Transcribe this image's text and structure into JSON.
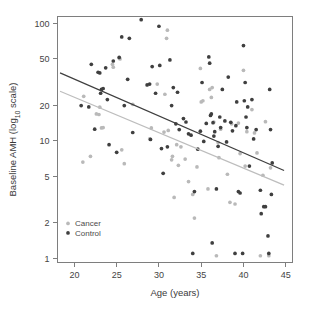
{
  "chart_data": {
    "type": "scatter",
    "title": "",
    "xlabel": "Age (years)",
    "ylabel": "Baseline AMH (log10 scale)",
    "ylabel_parts": {
      "pre": "Baseline AMH (log",
      "sub": "10",
      "post": " scale)"
    },
    "xlim": [
      18,
      45.8
    ],
    "ylim": [
      0.92,
      115
    ],
    "yscale": "log10",
    "xticks": [
      20,
      25,
      30,
      35,
      40,
      45
    ],
    "xtick_labels": [
      "20",
      "25",
      "30",
      "35",
      "40",
      "45"
    ],
    "yticks": [
      1,
      2,
      5,
      10,
      20,
      50,
      100
    ],
    "ytick_labels": [
      "1",
      "2",
      "5",
      "10",
      "20",
      "50",
      "100"
    ],
    "grid": false,
    "legend_position": "bottom-left",
    "legend": [
      {
        "name": "Cancer",
        "color": "#b9b9b9",
        "marker": "circle"
      },
      {
        "name": "Control",
        "color": "#3f3f3f",
        "marker": "circle"
      }
    ],
    "series": [
      {
        "name": "Cancer",
        "color": "#b9b9b9",
        "points": [
          [
            21.0,
            6.6
          ],
          [
            21.1,
            24.0
          ],
          [
            21.9,
            7.4
          ],
          [
            22.6,
            17.0
          ],
          [
            22.9,
            16.8
          ],
          [
            23.0,
            19.4
          ],
          [
            23.2,
            12.9
          ],
          [
            23.4,
            13.0
          ],
          [
            24.5,
            45.0
          ],
          [
            24.6,
            42.5
          ],
          [
            25.3,
            51.0
          ],
          [
            25.4,
            50.0
          ],
          [
            25.6,
            8.4
          ],
          [
            25.9,
            6.4
          ],
          [
            26.9,
            20.5
          ],
          [
            28.9,
            10.4
          ],
          [
            29.1,
            12.9
          ],
          [
            29.8,
            30.5
          ],
          [
            30.6,
            11.9
          ],
          [
            30.7,
            25.0
          ],
          [
            30.9,
            75.0
          ],
          [
            31.0,
            88.0
          ],
          [
            31.1,
            12.3
          ],
          [
            31.5,
            6.9
          ],
          [
            31.6,
            7.4
          ],
          [
            31.8,
            3.3
          ],
          [
            32.1,
            9.3
          ],
          [
            32.3,
            6.2
          ],
          [
            32.6,
            8.9
          ],
          [
            33.1,
            7.0
          ],
          [
            33.5,
            4.5
          ],
          [
            34.0,
            3.5
          ],
          [
            34.2,
            2.2
          ],
          [
            34.5,
            6.0
          ],
          [
            34.9,
            41.5
          ],
          [
            35.0,
            21.5
          ],
          [
            35.2,
            22.0
          ],
          [
            35.8,
            3.9
          ],
          [
            36.0,
            27.5
          ],
          [
            36.2,
            23.5
          ],
          [
            36.3,
            28.5
          ],
          [
            36.5,
            14.5
          ],
          [
            36.8,
            1.05
          ],
          [
            37.0,
            9.7
          ],
          [
            37.1,
            7.2
          ],
          [
            37.3,
            12.6
          ],
          [
            38.1,
            5.2
          ],
          [
            38.4,
            3.0
          ],
          [
            38.6,
            14.0
          ],
          [
            39.0,
            2.9
          ],
          [
            39.4,
            14.2
          ],
          [
            39.6,
            7.8
          ],
          [
            40.0,
            40.0
          ],
          [
            40.2,
            6.1
          ],
          [
            40.4,
            12.0
          ],
          [
            41.0,
            18.5
          ],
          [
            41.3,
            11.7
          ],
          [
            41.6,
            7.9
          ],
          [
            42.0,
            1.05
          ],
          [
            42.3,
            5.1
          ],
          [
            42.6,
            14.6
          ],
          [
            43.0,
            1.05
          ],
          [
            43.2,
            5.9
          ]
        ]
      },
      {
        "name": "Control",
        "color": "#3f3f3f",
        "points": [
          [
            20.8,
            20.0
          ],
          [
            21.7,
            19.5
          ],
          [
            22.0,
            45.0
          ],
          [
            22.4,
            12.6
          ],
          [
            22.8,
            38.5
          ],
          [
            23.0,
            38.0
          ],
          [
            23.1,
            25.5
          ],
          [
            23.2,
            27.5
          ],
          [
            23.4,
            28.0
          ],
          [
            23.7,
            42.0
          ],
          [
            23.9,
            22.5
          ],
          [
            24.1,
            9.3
          ],
          [
            24.6,
            48.0
          ],
          [
            25.0,
            8.0
          ],
          [
            25.3,
            51.5
          ],
          [
            25.6,
            77.0
          ],
          [
            25.9,
            20.0
          ],
          [
            26.3,
            33.5
          ],
          [
            26.5,
            75.0
          ],
          [
            26.9,
            11.8
          ],
          [
            27.9,
            108.0
          ],
          [
            28.6,
            30.0
          ],
          [
            28.9,
            30.5
          ],
          [
            29.0,
            10.3
          ],
          [
            29.2,
            43.0
          ],
          [
            29.6,
            25.5
          ],
          [
            30.0,
            95.0
          ],
          [
            30.1,
            44.0
          ],
          [
            30.3,
            8.6
          ],
          [
            30.5,
            5.3
          ],
          [
            31.0,
            8.9
          ],
          [
            31.3,
            49.0
          ],
          [
            31.5,
            20.0
          ],
          [
            31.7,
            28.5
          ],
          [
            32.0,
            14.0
          ],
          [
            32.2,
            26.0
          ],
          [
            32.4,
            12.5
          ],
          [
            32.9,
            15.5
          ],
          [
            33.2,
            14.5
          ],
          [
            33.5,
            11.5
          ],
          [
            33.8,
            11.2
          ],
          [
            34.0,
            1.1
          ],
          [
            34.2,
            3.7
          ],
          [
            34.6,
            8.5
          ],
          [
            34.9,
            12.1
          ],
          [
            35.1,
            31.5
          ],
          [
            35.3,
            9.9
          ],
          [
            35.6,
            14.1
          ],
          [
            35.9,
            52.0
          ],
          [
            36.0,
            46.0
          ],
          [
            36.1,
            16.5
          ],
          [
            36.2,
            17.0
          ],
          [
            36.3,
            1.35
          ],
          [
            36.4,
            14.3
          ],
          [
            36.5,
            11.0
          ],
          [
            36.6,
            12.0
          ],
          [
            36.8,
            3.9
          ],
          [
            37.0,
            9.0
          ],
          [
            37.2,
            16.0
          ],
          [
            37.3,
            13.0
          ],
          [
            37.5,
            27.5
          ],
          [
            37.8,
            14.8
          ],
          [
            38.0,
            9.8
          ],
          [
            38.2,
            35.0
          ],
          [
            38.5,
            14.4
          ],
          [
            38.7,
            12.2
          ],
          [
            39.0,
            1.1
          ],
          [
            39.1,
            13.5
          ],
          [
            39.2,
            21.5
          ],
          [
            39.4,
            3.7
          ],
          [
            39.6,
            3.6
          ],
          [
            39.9,
            1.1
          ],
          [
            40.0,
            65.0
          ],
          [
            40.1,
            22.0
          ],
          [
            40.2,
            31.5
          ],
          [
            40.3,
            16.0
          ],
          [
            40.4,
            13.0
          ],
          [
            40.5,
            19.5
          ],
          [
            40.7,
            6.1
          ],
          [
            41.0,
            22.5
          ],
          [
            41.2,
            10.4
          ],
          [
            41.5,
            12.5
          ],
          [
            42.0,
            3.8
          ],
          [
            42.1,
            2.4
          ],
          [
            42.4,
            2.75
          ],
          [
            42.6,
            2.75
          ],
          [
            42.9,
            1.55
          ],
          [
            43.0,
            1.1
          ],
          [
            43.1,
            27.5
          ],
          [
            43.2,
            12.5
          ],
          [
            43.3,
            3.5
          ],
          [
            43.4,
            6.5
          ]
        ]
      }
    ],
    "fit_lines": [
      {
        "name": "Control fit",
        "color": "#3f3f3f",
        "x": [
          18.3,
          44.8
        ],
        "y": [
          38.0,
          5.6
        ]
      },
      {
        "name": "Cancer fit",
        "color": "#bdbdbd",
        "x": [
          18.3,
          44.8
        ],
        "y": [
          26.5,
          4.2
        ]
      }
    ]
  }
}
